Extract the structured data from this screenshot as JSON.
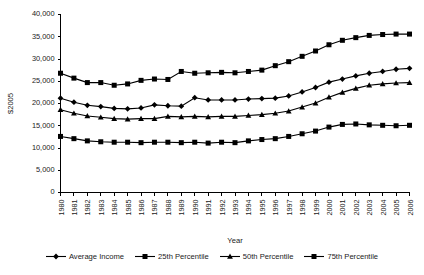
{
  "chart_data": {
    "type": "line",
    "title": "",
    "xlabel": "Year",
    "ylabel": "$2005",
    "ylim": [
      0,
      40000
    ],
    "ytick_values": [
      0,
      5000,
      10000,
      15000,
      20000,
      25000,
      30000,
      35000,
      40000
    ],
    "ytick_labels": [
      "0",
      "5,000",
      "10,000",
      "15,000",
      "20,000",
      "25,000",
      "30,000",
      "35,000",
      "40,000"
    ],
    "grid": false,
    "legend_position": "bottom",
    "categories": [
      1980,
      1981,
      1982,
      1983,
      1984,
      1985,
      1986,
      1987,
      1988,
      1989,
      1990,
      1991,
      1992,
      1993,
      1994,
      1995,
      1996,
      1997,
      1998,
      1999,
      2000,
      2001,
      2002,
      2003,
      2004,
      2005,
      2006
    ],
    "x": [
      "1980",
      "1981",
      "1982",
      "1983",
      "1984",
      "1985",
      "1986",
      "1987",
      "1988",
      "1989",
      "1990",
      "1991",
      "1992",
      "1993",
      "1994",
      "1995",
      "1996",
      "1997",
      "1998",
      "1999",
      "2000",
      "2001",
      "2002",
      "2003",
      "2004",
      "2005",
      "2006"
    ],
    "series": [
      {
        "name": "Average Income",
        "marker": "diamond",
        "values": [
          21200,
          20300,
          19600,
          19300,
          18900,
          18800,
          19000,
          19700,
          19500,
          19400,
          21300,
          20800,
          20800,
          20800,
          21000,
          21100,
          21200,
          21700,
          22600,
          23600,
          24800,
          25500,
          26200,
          26800,
          27200,
          27700,
          27900
        ]
      },
      {
        "name": "25th Percentile",
        "marker": "square",
        "values": [
          12600,
          12100,
          11600,
          11400,
          11300,
          11300,
          11200,
          11300,
          11300,
          11200,
          11300,
          11100,
          11300,
          11200,
          11600,
          11900,
          12100,
          12600,
          13200,
          13800,
          14700,
          15300,
          15400,
          15200,
          15100,
          15000,
          15100
        ]
      },
      {
        "name": "50th Percentile",
        "marker": "triangle",
        "values": [
          18600,
          17800,
          17200,
          16900,
          16600,
          16500,
          16600,
          16600,
          17100,
          17000,
          17100,
          17000,
          17100,
          17100,
          17300,
          17500,
          17800,
          18300,
          19200,
          20100,
          21400,
          22500,
          23400,
          24100,
          24400,
          24600,
          24700
        ]
      },
      {
        "name": "75th Percentile",
        "marker": "square",
        "values": [
          26800,
          25700,
          24700,
          24700,
          24100,
          24400,
          25200,
          25500,
          25400,
          27200,
          26800,
          26900,
          27000,
          26900,
          27200,
          27500,
          28500,
          29400,
          30600,
          31800,
          33200,
          34200,
          34800,
          35300,
          35500,
          35600,
          35600
        ]
      }
    ]
  },
  "legend": {
    "items": [
      {
        "label": "Average Income",
        "marker": "diamond"
      },
      {
        "label": "25th Percentile",
        "marker": "square"
      },
      {
        "label": "50th Percentile",
        "marker": "triangle"
      },
      {
        "label": "75th Percentile",
        "marker": "square"
      }
    ]
  }
}
